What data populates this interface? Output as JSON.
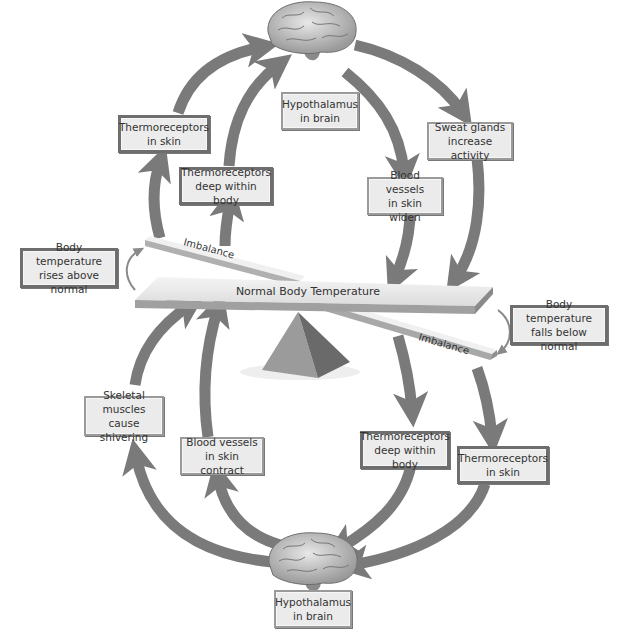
{
  "colors": {
    "arrow": "#7a7a7a",
    "box_fill": "#ebebeb",
    "box_border": "#9a9a9a",
    "beam_top": "#e8e8e8",
    "beam_side": "#a8a8a8",
    "fulcrum_light": "#9b9b9b",
    "fulcrum_dark": "#6a6a6a"
  },
  "center": {
    "beam_label": "Normal Body Temperature",
    "imbalance_top_label": "Imbalance",
    "imbalance_bottom_label": "Imbalance"
  },
  "stimuli": {
    "rise": {
      "line1": "Body temperature",
      "line2": "rises above normal"
    },
    "fall": {
      "line1": "Body temperature",
      "line2": "falls below normal"
    }
  },
  "top_loop": {
    "control_center": {
      "line1": "Hypothalamus",
      "line2": "in brain",
      "icon": "brain-icon"
    },
    "sensor_skin": {
      "line1": "Thermoreceptors",
      "line2": "in skin"
    },
    "sensor_deep": {
      "line1": "Thermoreceptors",
      "line2": "deep within body"
    },
    "effector_sweat": {
      "line1": "Sweat glands",
      "line2": "increase activity"
    },
    "effector_vessels": {
      "line1": "Blood vessels",
      "line2": "in skin widen"
    }
  },
  "bottom_loop": {
    "control_center": {
      "line1": "Hypothalamus",
      "line2": "in brain",
      "icon": "brain-icon"
    },
    "sensor_skin": {
      "line1": "Thermoreceptors",
      "line2": "in skin"
    },
    "sensor_deep": {
      "line1": "Thermoreceptors",
      "line2": "deep within body"
    },
    "effector_shiver": {
      "line1": "Skeletal muscles",
      "line2": "cause shivering"
    },
    "effector_vessels": {
      "line1": "Blood vessels",
      "line2": "in skin contract"
    }
  }
}
